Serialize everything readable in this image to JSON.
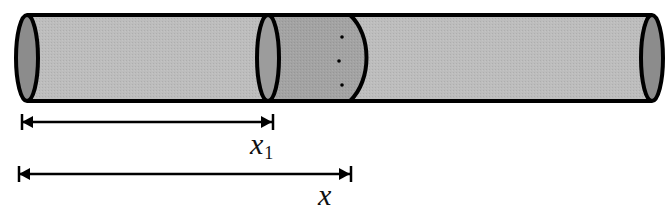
{
  "diagram": {
    "colors": {
      "tube_fill": "#bdbdbd",
      "slab_fill": "#a3a3a3",
      "end_cap_fill": "#8c8c8c",
      "stroke": "#000000",
      "background": "#ffffff"
    },
    "labels": {
      "x1_main": "x",
      "x1_sub": "1",
      "x_main": "x"
    },
    "dots_count": 3
  }
}
